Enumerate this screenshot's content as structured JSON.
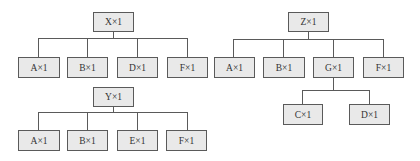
{
  "diagram": {
    "type": "tree-diagrams",
    "colors": {
      "node_fill": "#e9e9e9",
      "node_border": "#5a5a5a",
      "line": "#5a5a5a",
      "text": "#333333"
    },
    "trees": [
      {
        "root": "X×1",
        "children": [
          "A×1",
          "B×1",
          "D×1",
          "F×1"
        ]
      },
      {
        "root": "Y×1",
        "children": [
          "A×1",
          "B×1",
          "E×1",
          "F×1"
        ]
      },
      {
        "root": "Z×1",
        "children": [
          "A×1",
          "B×1",
          "G×1",
          "F×1"
        ],
        "subtree": {
          "parent": "G×1",
          "children": [
            "C×1",
            "D×1"
          ]
        }
      }
    ]
  }
}
